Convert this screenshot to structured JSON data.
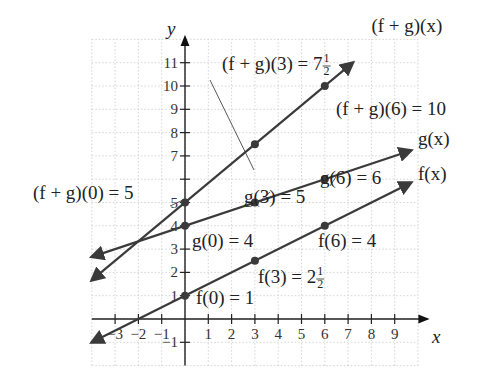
{
  "chart_data": {
    "type": "line",
    "title": "",
    "xlabel": "x",
    "ylabel": "y",
    "xlim": [
      -4,
      10
    ],
    "ylim": [
      -2,
      12
    ],
    "grid": true,
    "x_ticks": [
      -3,
      -2,
      -1,
      1,
      2,
      3,
      4,
      5,
      6,
      7,
      8,
      9
    ],
    "x_tick_labels": [
      "−3",
      "−2",
      "−1",
      "1",
      "2",
      "3",
      "4",
      "5",
      "6",
      "7",
      "8",
      "9"
    ],
    "y_ticks": [
      -1,
      1,
      2,
      3,
      4,
      5,
      7,
      8,
      9,
      10,
      11
    ],
    "y_tick_labels": [
      "−1",
      "1",
      "2",
      "3",
      "4",
      "5",
      "7",
      "8",
      "9",
      "10",
      "11"
    ],
    "series": [
      {
        "name": "f(x)",
        "label": "f(x)",
        "slope": 0.5,
        "intercept": 1,
        "x_range": [
          -4,
          9.7
        ],
        "points": [
          {
            "x": 0,
            "y": 1
          },
          {
            "x": 3,
            "y": 2.5
          },
          {
            "x": 6,
            "y": 4
          }
        ]
      },
      {
        "name": "g(x)",
        "label": "g(x)",
        "slope": 0.3333,
        "intercept": 4,
        "x_range": [
          -4,
          9.7
        ],
        "points": [
          {
            "x": 0,
            "y": 4
          },
          {
            "x": 3,
            "y": 5
          },
          {
            "x": 6,
            "y": 6
          }
        ]
      },
      {
        "name": "(f + g)(x)",
        "label": "(f + g)(x)",
        "slope": 0.8333,
        "intercept": 5,
        "x_range": [
          -4,
          7.2
        ],
        "points": [
          {
            "x": 0,
            "y": 5
          },
          {
            "x": 3,
            "y": 7.5
          },
          {
            "x": 6,
            "y": 10
          }
        ]
      }
    ],
    "annotations": [
      {
        "text": "(f + g)(0) = 5",
        "x": 0,
        "y": 5
      },
      {
        "text": "(f + g)(3) = 7",
        "frac": "1/2",
        "x": 3,
        "y": 7.5
      },
      {
        "text": "(f + g)(6) = 10",
        "x": 6,
        "y": 10
      },
      {
        "text": "g(0) = 4",
        "x": 0,
        "y": 4
      },
      {
        "text": "g(3) = 5",
        "x": 3,
        "y": 5
      },
      {
        "text": "g(6) = 6",
        "x": 6,
        "y": 6
      },
      {
        "text": "f(0) = 1",
        "x": 0,
        "y": 1
      },
      {
        "text": "f(3) = 2",
        "frac": "1/2",
        "x": 3,
        "y": 2.5
      },
      {
        "text": "f(6) = 4",
        "x": 6,
        "y": 4
      }
    ]
  }
}
